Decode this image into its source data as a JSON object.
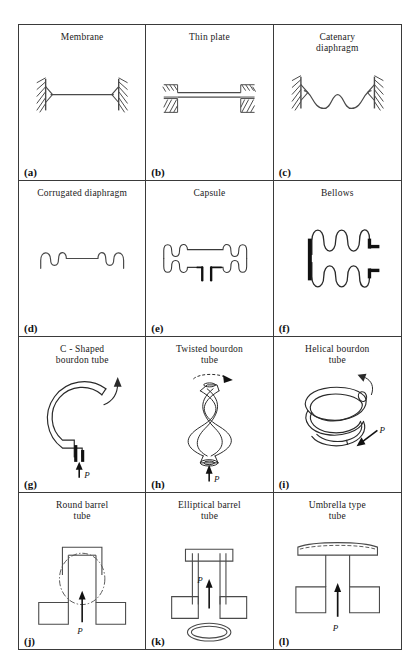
{
  "figure": {
    "kind": "technical-illustration-grid",
    "rows": 4,
    "cols": 3,
    "line_color": "#3a3a3a",
    "background": "#ffffff",
    "pressure_symbol": "P",
    "bottom_caption": "",
    "panels": [
      {
        "label": "(a)",
        "title": "Membrane",
        "art": "membrane"
      },
      {
        "label": "(b)",
        "title": "Thin  plate",
        "art": "thin-plate"
      },
      {
        "label": "(c)",
        "title": "Catenary\ndiaphragm",
        "art": "catenary-diaphragm"
      },
      {
        "label": "(d)",
        "title": "Corrugated  diaphragm",
        "art": "corrugated-diaphragm"
      },
      {
        "label": "(e)",
        "title": "Capsule",
        "art": "capsule"
      },
      {
        "label": "(f)",
        "title": "Bellows",
        "art": "bellows"
      },
      {
        "label": "(g)",
        "title": "C - Shaped\nbourdon  tube",
        "art": "c-shaped-bourdon-tube"
      },
      {
        "label": "(h)",
        "title": "Twisted  bourdon\ntube",
        "art": "twisted-bourdon-tube"
      },
      {
        "label": "(i)",
        "title": "Helical  bourdon\ntube",
        "art": "helical-bourdon-tube"
      },
      {
        "label": "(j)",
        "title": "Round  barrel\ntube",
        "art": "round-barrel-tube"
      },
      {
        "label": "(k)",
        "title": "Elliptical  barrel\ntube",
        "art": "elliptical-barrel-tube"
      },
      {
        "label": "(l)",
        "title": "Umbrella  type\ntube",
        "art": "umbrella-type-tube"
      }
    ]
  }
}
